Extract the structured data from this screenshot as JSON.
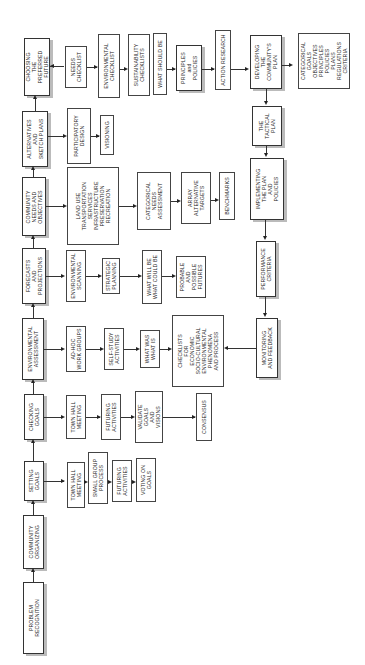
{
  "diagram": {
    "orientation": "rotated-90-ccw",
    "main_flow": [
      {
        "id": "problem",
        "label": "PROBLEM\nRECOGNITION"
      },
      {
        "id": "organizing",
        "label": "COMMUNITY\nORGANIZING"
      },
      {
        "id": "setting",
        "label": "SETTING\nGOALS"
      },
      {
        "id": "checking",
        "label": "CHECKING\nGOALS"
      },
      {
        "id": "envassess",
        "label": "ENVIRONMENTAL\nASSESSMENT"
      },
      {
        "id": "forecasts",
        "label": "FORECASTS\nAND\nPROJECTIONS"
      },
      {
        "id": "needs",
        "label": "COMMUNITY\nNEEDS AND\nOBJECTIVES"
      },
      {
        "id": "alternatives",
        "label": "ALTERNATIVES\nAND\nSKETCH PLANS"
      },
      {
        "id": "choosing",
        "label": "CHOOSING\nTHE\nPREFERRED\nFUTURE"
      }
    ],
    "setting_goals_branch": [
      {
        "label": "TOWN HALL\nMEETING"
      },
      {
        "label": "SMALL GROUP\nPROCESS"
      },
      {
        "label": "FUTURING\nACTIVITIES"
      },
      {
        "label": "VOTING ON\nGOALS"
      }
    ],
    "checking_goals_branch": [
      {
        "label": "TOWN HALL\nMEETING"
      },
      {
        "label": "FUTURING\nACTIVITIES"
      },
      {
        "label": "VALIDATE\nGOALS\nAND\nVISIONS"
      },
      {
        "label": "CONSENSUS"
      }
    ],
    "env_assessment_branch": [
      {
        "label": "AD-HOC\nWORK GROUPS"
      },
      {
        "label": "SELF-STUDY\nACTIVITIES"
      },
      {
        "label": "WHAT WAS\nWHAT IS"
      },
      {
        "label": "CHECKLISTS\nFOR\nECONOMIC\nSOCIO-CULTURAL\nENVIRONMENTAL\nPHENOMENA\nAND PROCESS"
      }
    ],
    "forecasts_branch": [
      {
        "label": "ENVIRONMENTAL\nSCANNING"
      },
      {
        "label": "STRATEGIC\nPLANNING"
      },
      {
        "label": "WHAT WILL BE\nWHAT COULD BE"
      },
      {
        "label": "PROBABLE\nAND\nPOSSIBLE\nFUTURES"
      }
    ],
    "needs_branch": [
      {
        "label": "LAND USE\nTRANSPORTATION\nSERVICES\nINFRASTRUCTURE\nPRESERVATION\nRECREATION"
      },
      {
        "label": "CATEGORICAL\nNEEDS\nASSESSMENT"
      },
      {
        "label": "ARRAY\nALTERNATIVE\nTARGETS"
      },
      {
        "label": "BENCHMARKS"
      }
    ],
    "alternatives_branch": [
      {
        "label": "PARTICIPATORY\nDESIGN"
      },
      {
        "label": "VISIONING"
      }
    ],
    "choosing_branch": [
      {
        "label": "NEEDS\nCHECKLIST"
      },
      {
        "label": "ENVIRONMENTAL\nCHECKLIST"
      },
      {
        "label": "SUSTAINABILITY\nCHECKLISTS"
      },
      {
        "label": "WHAT SHOULD BE"
      },
      {
        "label": "PRINCIPLES\nand\nPOLICIES"
      },
      {
        "label": "ACTION RESEARCH"
      }
    ],
    "plan_flow": [
      {
        "label": "DEVELOPING\nTHE\nCOMMUNITY'S\nPLAN"
      },
      {
        "label": "CATEGORICAL\nGOALS\nOBJECTIVES\nPRINCIPLES\nPOLICIES\nPLANS\nREGULATIONS\nCRITERIA"
      },
      {
        "label": "THE\nTACTICAL\nPLAN"
      },
      {
        "label": "IMPLEMENTING\nTHE PLAN\nAND\nPOLICIES"
      },
      {
        "label": "PERFORMANCE\nCRITERIA"
      },
      {
        "label": "MONITORING\nAND FEEDBACK"
      }
    ]
  }
}
